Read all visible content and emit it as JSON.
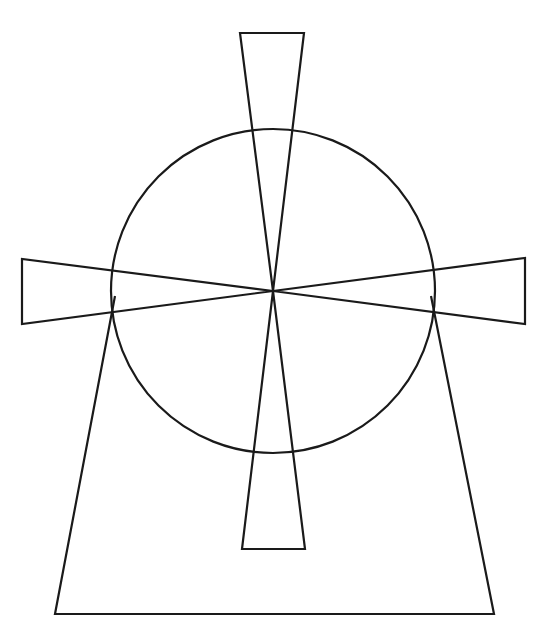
{
  "diagram": {
    "title": "",
    "canvas": {
      "width": 543,
      "height": 633,
      "background": "#ffffff"
    },
    "stroke": {
      "color": "#1a1a1a",
      "width": 2.2
    },
    "hub": {
      "x": 273,
      "y": 291
    },
    "circle": {
      "cx": 273,
      "cy": 291,
      "r": 162
    },
    "blades": [
      {
        "name": "top",
        "points": "240,33 304,33 273,291"
      },
      {
        "name": "bottom",
        "points": "242,549 305,549 273,291"
      },
      {
        "name": "left",
        "points": "22,259 22,324 273,291"
      },
      {
        "name": "right",
        "points": "525,258 525,324 273,291"
      }
    ],
    "tower": {
      "points": "115,296 55,614 494,614 431,296"
    }
  }
}
